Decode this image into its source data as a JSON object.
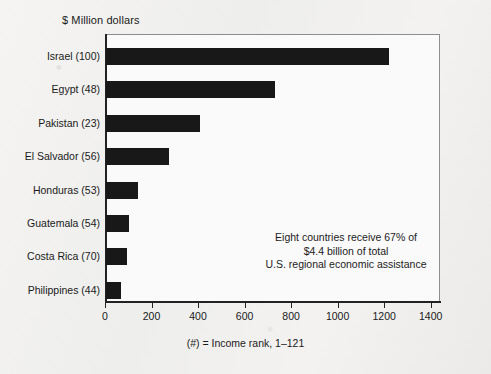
{
  "chart_data": {
    "type": "bar",
    "orientation": "horizontal",
    "title": "",
    "ylabel": "$ Million dollars",
    "xlabel": "(#) = Income rank, 1–121",
    "categories": [
      "Israel (100)",
      "Egypt (48)",
      "Pakistan (23)",
      "El Salvador (56)",
      "Honduras (53)",
      "Guatemala (54)",
      "Costa Rica (70)",
      "Philippines (44)"
    ],
    "values": [
      1220,
      730,
      410,
      275,
      140,
      103,
      95,
      70
    ],
    "xlim": [
      0,
      1440
    ],
    "xticks": [
      0,
      200,
      400,
      600,
      800,
      1000,
      1200,
      1400
    ],
    "xtick_labels": [
      "0",
      "200",
      "400",
      "600",
      "800",
      "1000",
      "1200",
      "1400"
    ],
    "grid": false,
    "legend": false,
    "bar_color": "#181818",
    "annotations": [
      {
        "lines": [
          "Eight countries receive 67% of",
          "$4.4 billion of total",
          "U.S. regional economic assistance"
        ],
        "align": "center"
      }
    ]
  },
  "colors": {
    "background": "#f2f1ef",
    "plot_background": "#fbfafa",
    "axis": "#222222",
    "frame": "#8d8d8d",
    "text": "#1a1a1a",
    "bar": "#181818"
  }
}
